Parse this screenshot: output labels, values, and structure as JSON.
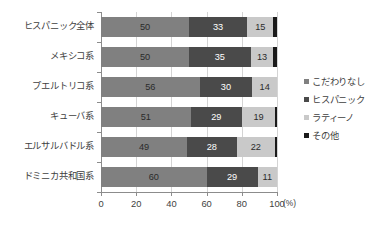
{
  "chart_data": {
    "type": "bar",
    "subtype": "stacked-horizontal-100",
    "title": "",
    "xlabel": "(%)",
    "ylabel": "",
    "xlim": [
      0,
      100
    ],
    "xticks": [
      "0",
      "20",
      "40",
      "60",
      "80",
      "100"
    ],
    "grid": true,
    "legend_position": "right",
    "categories": [
      "ヒスパニック全体",
      "メキシコ系",
      "プエルトリコ系",
      "キューバ系",
      "エルサルバドル系",
      "ドミニカ共和国系"
    ],
    "series": [
      {
        "name": "こだわりなし",
        "color": "#808080",
        "values": [
          50,
          50,
          56,
          51,
          49,
          60
        ],
        "labels": [
          "50",
          "50",
          "56",
          "51",
          "49",
          "60"
        ]
      },
      {
        "name": "ヒスパニック",
        "color": "#4a4a4a",
        "values": [
          33,
          35,
          30,
          29,
          28,
          29
        ],
        "labels": [
          "33",
          "35",
          "30",
          "29",
          "28",
          "29"
        ]
      },
      {
        "name": "ラティーノ",
        "color": "#c9c9c9",
        "values": [
          15,
          13,
          14,
          19,
          22,
          11
        ],
        "labels": [
          "15",
          "13",
          "14",
          "19",
          "22",
          "11"
        ]
      },
      {
        "name": "その他",
        "color": "#1a1a1a",
        "values": [
          2,
          2,
          0,
          1,
          1,
          0
        ],
        "labels": [
          "",
          "",
          "",
          "",
          "",
          ""
        ]
      }
    ]
  },
  "axis_unit": "(%)",
  "legend": {
    "items": [
      {
        "label": "こだわりなし",
        "color": "#808080"
      },
      {
        "label": "ヒスパニック",
        "color": "#4a4a4a"
      },
      {
        "label": "ラティーノ",
        "color": "#c9c9c9"
      },
      {
        "label": "その他",
        "color": "#1a1a1a"
      }
    ]
  }
}
